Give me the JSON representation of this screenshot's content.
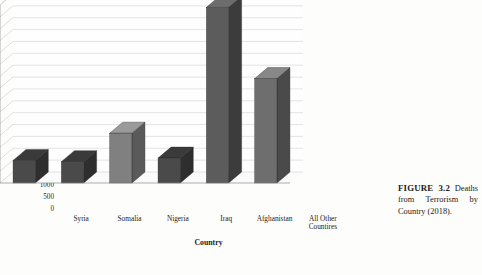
{
  "figure": {
    "caption_label": "FIGURE 3.2",
    "caption_text": "Deaths from Terrorism by Country (2018)."
  },
  "chart_data": {
    "type": "bar",
    "title": "Deaths from Terrorism by Country (2018)",
    "xlabel": "Country",
    "ylabel": "No. of Deaths",
    "categories": [
      "Syria",
      "Somalia",
      "Nigeria",
      "Iraq",
      "Afghanistan",
      "All Other Countires"
    ],
    "values": [
      950,
      900,
      2100,
      1050,
      7400,
      4400
    ],
    "ylim": [
      0,
      7500
    ],
    "ytick_labels": [
      "0",
      "500",
      "1000",
      "1500",
      "2000",
      "2500",
      "3000",
      "3500",
      "4000",
      "4500",
      "5000",
      "5500",
      "6000",
      "6500",
      "7000",
      "7500"
    ],
    "ytick_values": [
      0,
      500,
      1000,
      1500,
      2000,
      2500,
      3000,
      3500,
      4000,
      4500,
      5000,
      5500,
      6000,
      6500,
      7000,
      7500
    ],
    "grid": true,
    "legend": "none",
    "style": "3d-column",
    "bar_colors": [
      "#4a4a4a",
      "#4a4a4a",
      "#808080",
      "#4a4a4a",
      "#5c5c5c",
      "#6e6e6e"
    ],
    "bar_side_colors": [
      "#2e2e2e",
      "#2e2e2e",
      "#5a5a5a",
      "#2e2e2e",
      "#3c3c3c",
      "#4a4a4a"
    ],
    "bar_top_colors": [
      "#3a3a3a",
      "#3a3a3a",
      "#9a9a9a",
      "#3a3a3a",
      "#6d6d6d",
      "#888888"
    ]
  }
}
